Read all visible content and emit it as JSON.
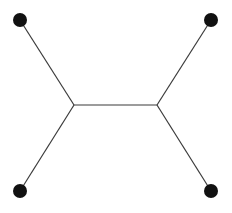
{
  "diagram": {
    "type": "unrooted-tree",
    "colors": {
      "edge": "#3a3a3a",
      "node": "#111111",
      "background": "#ffffff"
    },
    "nodes": [
      {
        "id": "leaf-top-left",
        "x": 20,
        "y": 20,
        "kind": "leaf"
      },
      {
        "id": "leaf-top-right",
        "x": 211,
        "y": 20,
        "kind": "leaf"
      },
      {
        "id": "leaf-bottom-left",
        "x": 20,
        "y": 191,
        "kind": "leaf"
      },
      {
        "id": "leaf-bottom-right",
        "x": 211,
        "y": 191,
        "kind": "leaf"
      },
      {
        "id": "internal-left",
        "x": 74,
        "y": 105,
        "kind": "internal"
      },
      {
        "id": "internal-right",
        "x": 157,
        "y": 105,
        "kind": "internal"
      }
    ],
    "edges": [
      [
        "leaf-top-left",
        "internal-left"
      ],
      [
        "leaf-bottom-left",
        "internal-left"
      ],
      [
        "internal-left",
        "internal-right"
      ],
      [
        "internal-right",
        "leaf-top-right"
      ],
      [
        "internal-right",
        "leaf-bottom-right"
      ]
    ]
  }
}
